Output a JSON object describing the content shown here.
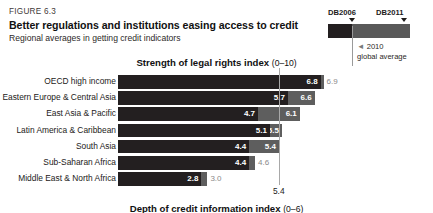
{
  "header": {
    "figure_number": "FIGURE 6.3",
    "title": "Better regulations and institutions easing access to credit",
    "subtitle": "Regional averages in getting credit indicators"
  },
  "legend": {
    "label_db2006": "DB2006",
    "label_db2011": "DB2011",
    "note_line1": "2010",
    "note_line2": "global average",
    "dash_marker": "◄",
    "color_db2006": "#231f20",
    "color_db2011": "#5e5e5e",
    "color_avg_line": "#a8a8a8"
  },
  "chart_top": {
    "title": "Strength of legal rights index",
    "range": "(0–10)",
    "global_average_label": "5.4"
  },
  "chart_bottom": {
    "title": "Depth of credit information index",
    "range": "(0–6)"
  },
  "chart_data": {
    "type": "bar",
    "orientation": "horizontal",
    "title": "Strength of legal rights index (0–10)",
    "xlabel": "",
    "ylabel": "",
    "xlim": [
      0,
      10
    ],
    "grid": false,
    "legend_position": "top-right",
    "annotations": [
      {
        "text": "2010 global average",
        "value": 5.4,
        "type": "vline"
      }
    ],
    "categories": [
      "OECD high income",
      "Eastern Europe & Central Asia",
      "East Asia & Pacific",
      "Latin America & Caribbean",
      "South Asia",
      "Sub-Saharan Africa",
      "Middle East & North Africa"
    ],
    "series": [
      {
        "name": "DB2006",
        "color": "#231f20",
        "values": [
          6.8,
          5.7,
          4.7,
          5.1,
          4.4,
          4.4,
          2.8
        ]
      },
      {
        "name": "DB2011",
        "color": "#5e5e5e",
        "values": [
          6.9,
          6.6,
          6.1,
          5.5,
          5.4,
          4.6,
          3.0
        ]
      }
    ],
    "rows": [
      {
        "label": "OECD high income",
        "db2006": "6.8",
        "db2011": "6.9",
        "db2011_outside": true
      },
      {
        "label": "Eastern Europe & Central Asia",
        "db2006": "5.7",
        "db2011": "6.6",
        "db2011_outside": false
      },
      {
        "label": "East Asia & Pacific",
        "db2006": "4.7",
        "db2011": "6.1",
        "db2011_outside": false
      },
      {
        "label": "Latin America & Caribbean",
        "db2006": "5.1",
        "db2011": "5.5",
        "db2011_outside": false
      },
      {
        "label": "South Asia",
        "db2006": "4.4",
        "db2011": "5.4",
        "db2011_outside": false
      },
      {
        "label": "Sub-Saharan Africa",
        "db2006": "4.4",
        "db2011": "4.6",
        "db2011_outside": true
      },
      {
        "label": "Middle East & North Africa",
        "db2006": "2.8",
        "db2011": "3.0",
        "db2011_outside": true
      }
    ]
  }
}
